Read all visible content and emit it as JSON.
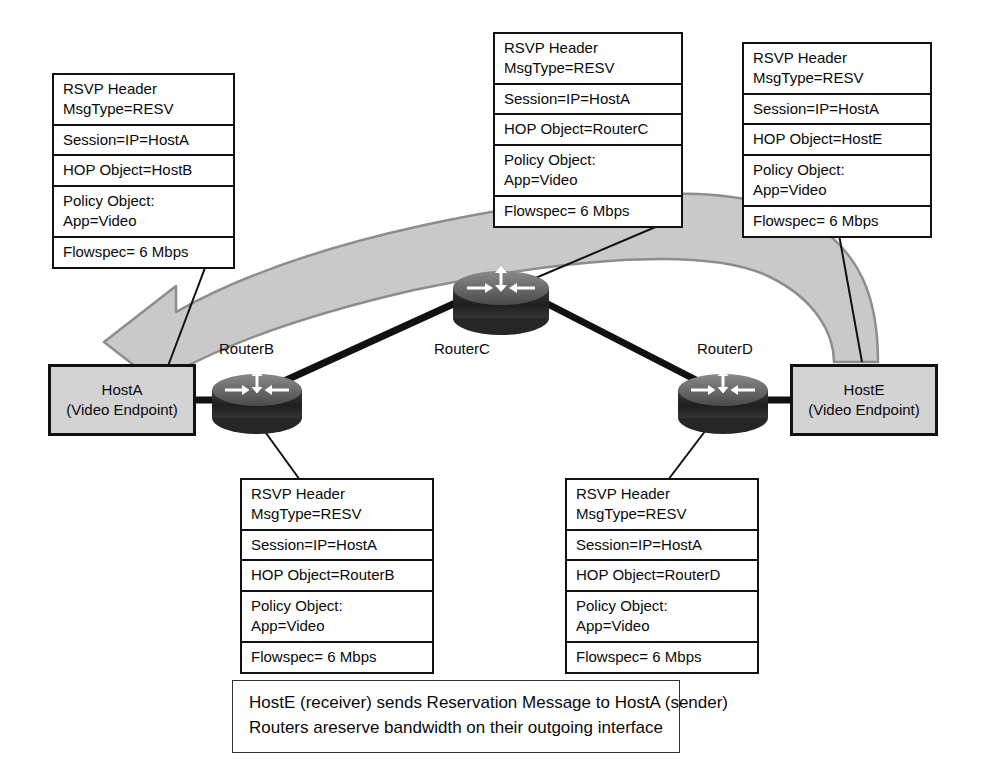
{
  "diagram": {
    "colors": {
      "host_fill": "#d3d3d3",
      "router_body": "#2b2b2b",
      "router_top": "#6e6e6e",
      "flow_arrow_fill": "#c9c9c9",
      "flow_arrow_stroke": "#8a8a8a",
      "line": "#111111"
    }
  },
  "packets": {
    "hostb": {
      "name": "packet-hostb",
      "rows": [
        {
          "lines": [
            "RSVP Header",
            "MsgType=RESV"
          ]
        },
        {
          "lines": [
            "Session=IP=HostA"
          ]
        },
        {
          "lines": [
            "HOP Object=HostB"
          ]
        },
        {
          "lines": [
            "Policy Object:",
            "App=Video"
          ]
        },
        {
          "lines": [
            "Flowspec= 6 Mbps"
          ]
        }
      ]
    },
    "routerc": {
      "name": "packet-routerc",
      "rows": [
        {
          "lines": [
            "RSVP Header",
            "MsgType=RESV"
          ]
        },
        {
          "lines": [
            "Session=IP=HostA"
          ]
        },
        {
          "lines": [
            "HOP Object=RouterC"
          ]
        },
        {
          "lines": [
            "Policy Object:",
            "App=Video"
          ]
        },
        {
          "lines": [
            "Flowspec= 6 Mbps"
          ]
        }
      ]
    },
    "hoste": {
      "name": "packet-hoste",
      "rows": [
        {
          "lines": [
            "RSVP Header",
            "MsgType=RESV"
          ]
        },
        {
          "lines": [
            "Session=IP=HostA"
          ]
        },
        {
          "lines": [
            "HOP Object=HostE"
          ]
        },
        {
          "lines": [
            "Policy Object:",
            "App=Video"
          ]
        },
        {
          "lines": [
            "Flowspec= 6 Mbps"
          ]
        }
      ]
    },
    "routerb": {
      "name": "packet-routerb",
      "rows": [
        {
          "lines": [
            "RSVP Header",
            "MsgType=RESV"
          ]
        },
        {
          "lines": [
            "Session=IP=HostA"
          ]
        },
        {
          "lines": [
            "HOP Object=RouterB"
          ]
        },
        {
          "lines": [
            "Policy Object:",
            "App=Video"
          ]
        },
        {
          "lines": [
            "Flowspec= 6 Mbps"
          ]
        }
      ]
    },
    "routerd": {
      "name": "packet-routerd",
      "rows": [
        {
          "lines": [
            "RSVP Header",
            "MsgType=RESV"
          ]
        },
        {
          "lines": [
            "Session=IP=HostA"
          ]
        },
        {
          "lines": [
            "HOP Object=RouterD"
          ]
        },
        {
          "lines": [
            "Policy Object:",
            "App=Video"
          ]
        },
        {
          "lines": [
            "Flowspec= 6 Mbps"
          ]
        }
      ]
    }
  },
  "hosts": {
    "hostA": {
      "line1": "HostA",
      "line2": "(Video Endpoint)"
    },
    "hostE": {
      "line1": "HostE",
      "line2": "(Video Endpoint)"
    }
  },
  "routers": {
    "routerB": {
      "label": "RouterB"
    },
    "routerC": {
      "label": "RouterC"
    },
    "routerD": {
      "label": "RouterD"
    }
  },
  "caption": {
    "line1": "HostE (receiver) sends Reservation Message to HostA (sender)",
    "line2": "Routers areserve bandwidth on their outgoing interface"
  }
}
